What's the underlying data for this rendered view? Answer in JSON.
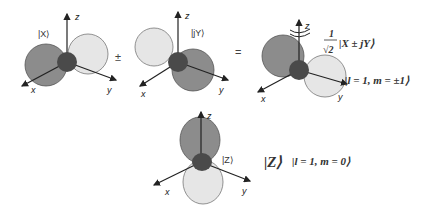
{
  "diagram": {
    "orbital_x": {
      "label": "|X⟩",
      "axes": {
        "x": "x",
        "y": "y",
        "z": "z"
      }
    },
    "operator_pm": "±",
    "orbital_jy": {
      "label": "|jY⟩",
      "axes": {
        "x": "x",
        "y": "y",
        "z": "z"
      }
    },
    "operator_eq": "=",
    "orbital_combined": {
      "axes": {
        "x": "x",
        "y": "y",
        "z": "z"
      },
      "coef_num": "1",
      "coef_den": "√2",
      "ket": "|X ± jY⟩",
      "state": "|l = 1, m = ±1⟩"
    },
    "orbital_z": {
      "label": "|Z⟩",
      "axes": {
        "x": "x",
        "y": "y",
        "z": "z"
      },
      "ket": "|Z⟩",
      "state": "|l = 1, m = 0⟩"
    },
    "colors": {
      "dark_lobe": "#8c8c8c",
      "light_lobe": "#e6e6e6",
      "center": "#4a4a4a",
      "axis": "#222222"
    }
  }
}
